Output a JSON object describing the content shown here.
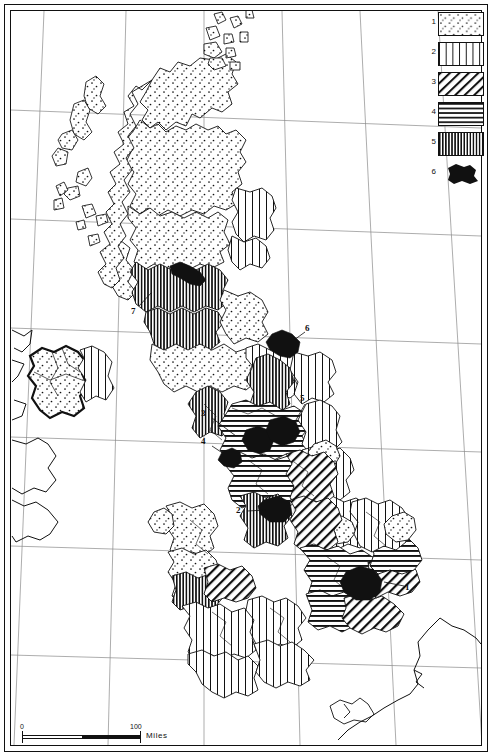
{
  "map": {
    "title": "Thematic map of the British Isles",
    "projection_note": "conic graticule with meridians and parallels",
    "background": "#ffffff",
    "ink": "#111111"
  },
  "legend": {
    "position": "top-right",
    "items": [
      {
        "number": "1",
        "pattern": "stipple-dots",
        "swatch_name": "legend-swatch-stipple"
      },
      {
        "number": "2",
        "pattern": "vertical-lines-wide",
        "swatch_name": "legend-swatch-vertical-wide"
      },
      {
        "number": "3",
        "pattern": "diagonal-hatch",
        "swatch_name": "legend-swatch-diagonal"
      },
      {
        "number": "4",
        "pattern": "horizontal-lines",
        "swatch_name": "legend-swatch-horizontal"
      },
      {
        "number": "5",
        "pattern": "vertical-lines-dense",
        "swatch_name": "legend-swatch-vertical-dense"
      },
      {
        "number": "6",
        "pattern": "solid-black-blob",
        "swatch_name": "legend-swatch-solid"
      }
    ]
  },
  "map_labels": [
    {
      "id": "1",
      "text": "1",
      "x": 409,
      "y": 588,
      "region": "south-east-conurbation"
    },
    {
      "id": "2",
      "text": "2",
      "x": 240,
      "y": 511,
      "region": "west-midlands-conurbation"
    },
    {
      "id": "3",
      "text": "3",
      "x": 205,
      "y": 414,
      "region": "merseyside-conurbation"
    },
    {
      "id": "4",
      "text": "4",
      "x": 205,
      "y": 442,
      "region": "manchester-conurbation"
    },
    {
      "id": "5",
      "text": "5",
      "x": 303,
      "y": 399,
      "region": "west-yorkshire-conurbation"
    },
    {
      "id": "6",
      "text": "6",
      "x": 308,
      "y": 329,
      "region": "tyneside-conurbation"
    },
    {
      "id": "7",
      "text": "7",
      "x": 134,
      "y": 312,
      "region": "clydeside-conurbation"
    }
  ],
  "scale": {
    "start_label": "0",
    "end_label": "100",
    "unit_label": "Miles"
  }
}
